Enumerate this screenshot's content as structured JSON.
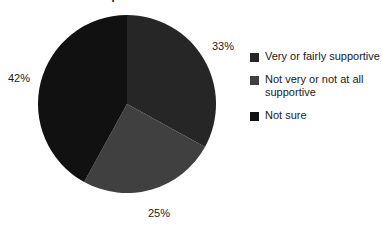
{
  "chart_data": {
    "type": "pie",
    "title": "respondents based on Shariah Law",
    "categories": [
      "Very or fairly supportive",
      "Not very or not at all supportive",
      "Not sure"
    ],
    "values": [
      33,
      25,
      42
    ],
    "value_labels": [
      "33%",
      "25%",
      "42%"
    ],
    "colors": [
      "#262626",
      "#404040",
      "#111111"
    ],
    "units": "percent",
    "start_angle_deg": 0,
    "direction": "clockwise",
    "legend_position": "right",
    "grid": false,
    "xlabel": "",
    "ylabel": "",
    "slices": [
      {
        "label": "Very or fairly supportive",
        "value": 33,
        "value_label": "33%",
        "color": "#262626"
      },
      {
        "label": "Not very or not at all supportive",
        "value": 25,
        "value_label": "25%",
        "color": "#404040"
      },
      {
        "label": "Not sure",
        "value": 42,
        "value_label": "42%",
        "color": "#111111"
      }
    ]
  },
  "legend": {
    "items": [
      {
        "label": "Very or fairly supportive",
        "color": "#262626"
      },
      {
        "label": "Not very or not at all supportive",
        "color": "#404040"
      },
      {
        "label": "Not sure",
        "color": "#111111"
      }
    ]
  }
}
